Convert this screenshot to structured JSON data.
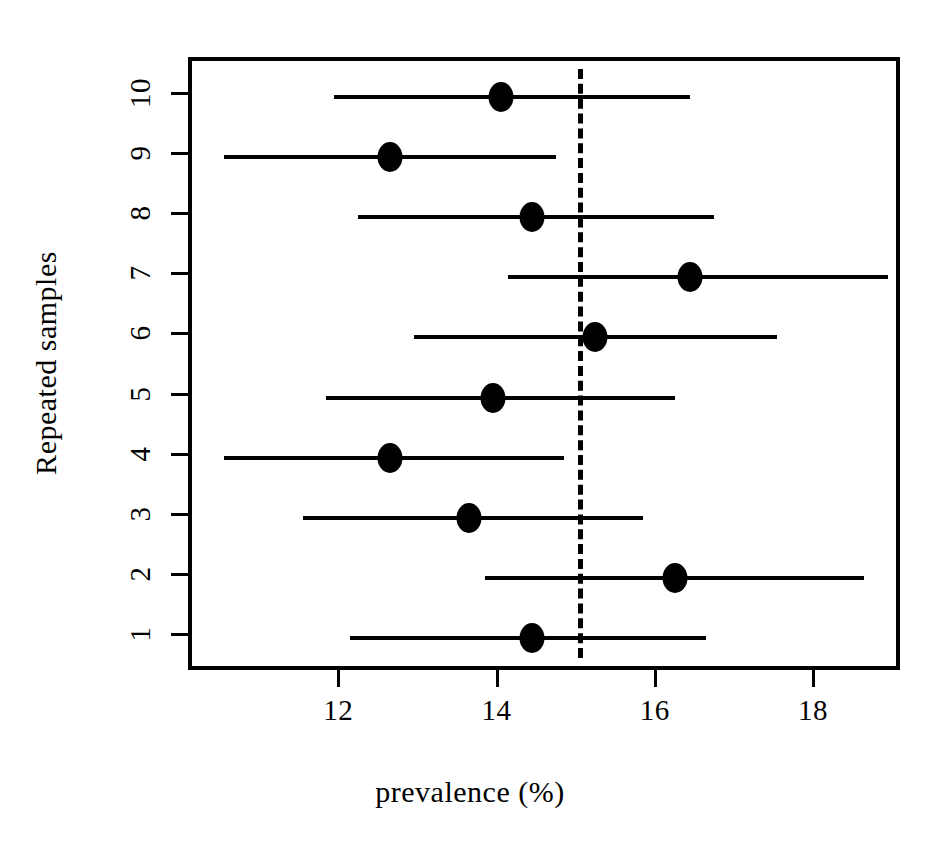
{
  "chart_data": {
    "type": "scatter",
    "title": "",
    "xlabel": "prevalence (%)",
    "ylabel": "Repeated samples",
    "xlim": [
      10.1,
      19.1
    ],
    "ylim": [
      0.4,
      10.6
    ],
    "grid": false,
    "legend": null,
    "xticks": [
      12,
      14,
      16,
      18
    ],
    "xticklabels": [
      "12",
      "14",
      "16",
      "18"
    ],
    "yticks": [
      1,
      2,
      3,
      4,
      5,
      6,
      7,
      8,
      9,
      10
    ],
    "yticklabels": [
      "1",
      "2",
      "3",
      "4",
      "5",
      "6",
      "7",
      "8",
      "9",
      "10"
    ],
    "reference_line": {
      "orientation": "vertical",
      "value": 15.0,
      "style": "dashed",
      "color": "#000000"
    },
    "marker": {
      "shape": "circle",
      "color": "#000000",
      "size": 26
    },
    "error_bar_color": "#000000",
    "categories": [
      "1",
      "2",
      "3",
      "4",
      "5",
      "6",
      "7",
      "8",
      "9",
      "10"
    ],
    "series": [
      {
        "name": "prevalence estimate",
        "values": [
          14.4,
          16.2,
          13.6,
          12.6,
          13.9,
          15.2,
          16.4,
          14.4,
          12.6,
          14.0
        ]
      },
      {
        "name": "95% CI lower",
        "values": [
          12.1,
          13.8,
          11.5,
          10.5,
          11.8,
          12.9,
          14.1,
          12.2,
          10.5,
          11.9
        ]
      },
      {
        "name": "95% CI upper",
        "values": [
          16.6,
          18.6,
          15.8,
          14.8,
          16.2,
          17.5,
          18.9,
          16.7,
          14.7,
          16.4
        ]
      }
    ],
    "points": [
      {
        "sample": "1",
        "estimate": 14.4,
        "ci_low": 12.1,
        "ci_high": 16.6
      },
      {
        "sample": "2",
        "estimate": 16.2,
        "ci_low": 13.8,
        "ci_high": 18.6
      },
      {
        "sample": "3",
        "estimate": 13.6,
        "ci_low": 11.5,
        "ci_high": 15.8
      },
      {
        "sample": "4",
        "estimate": 12.6,
        "ci_low": 10.5,
        "ci_high": 14.8
      },
      {
        "sample": "5",
        "estimate": 13.9,
        "ci_low": 11.8,
        "ci_high": 16.2
      },
      {
        "sample": "6",
        "estimate": 15.2,
        "ci_low": 12.9,
        "ci_high": 17.5
      },
      {
        "sample": "7",
        "estimate": 16.4,
        "ci_low": 14.1,
        "ci_high": 18.9
      },
      {
        "sample": "8",
        "estimate": 14.4,
        "ci_low": 12.2,
        "ci_high": 16.7
      },
      {
        "sample": "9",
        "estimate": 12.6,
        "ci_low": 10.5,
        "ci_high": 14.7
      },
      {
        "sample": "10",
        "estimate": 14.0,
        "ci_low": 11.9,
        "ci_high": 16.4
      }
    ]
  }
}
